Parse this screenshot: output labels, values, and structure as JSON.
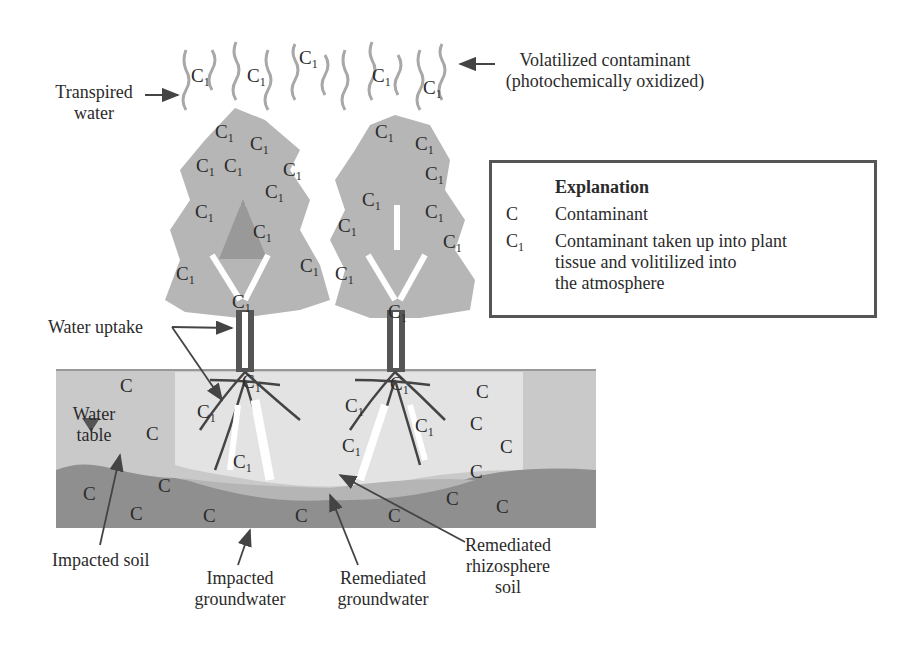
{
  "diagram": {
    "labels": {
      "transpired_water": [
        "Transpired",
        "water"
      ],
      "volatilized": [
        "Volatilized contaminant",
        "(photochemically oxidized)"
      ],
      "water_uptake": "Water uptake",
      "water_table": [
        "Water",
        "table"
      ],
      "impacted_soil": "Impacted soil",
      "impacted_groundwater": [
        "Impacted",
        "groundwater"
      ],
      "remediated_groundwater": [
        "Remediated",
        "groundwater"
      ],
      "remediated_rhizosphere": [
        "Remediated",
        "rhizosphere",
        "soil"
      ]
    },
    "legend": {
      "title": "Explanation",
      "items": [
        {
          "symbol": "C",
          "subscript": "",
          "text": [
            "Contaminant"
          ]
        },
        {
          "symbol": "C",
          "subscript": "1",
          "text": [
            "Contaminant taken up into plant",
            "tissue and volitilized into",
            "the atmosphere"
          ]
        }
      ]
    },
    "symbols": {
      "contaminant": "C",
      "contaminant_plant": "C",
      "subscript": "1"
    },
    "colors": {
      "impacted_soil": "#c9c9c9",
      "remediated_soil": "#e2e2e2",
      "groundwater": "#8f8f8f",
      "remediated_groundwater": "#b8b8b8",
      "foliage": "#b3b3b3",
      "trunk": "#555555",
      "text": "#2b2b2b"
    }
  }
}
